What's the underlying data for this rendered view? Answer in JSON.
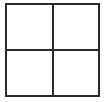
{
  "figure": {
    "kind": "quadrant-grid",
    "background_color": "#ffffff",
    "line_color": "#2a2a2a",
    "outer_line_width_px": 2,
    "inner_line_width_px": 2,
    "rows": 2,
    "columns": 2,
    "caption": "",
    "title": ""
  },
  "chart_data": {
    "type": "table",
    "title": "",
    "xlabel": "",
    "ylabel": "",
    "rows": 2,
    "columns": 2,
    "grid": true,
    "legend": "none",
    "cells": [
      {
        "row": 0,
        "col": 0,
        "name": "top-left",
        "text": "",
        "fill": "#ffffff"
      },
      {
        "row": 0,
        "col": 1,
        "name": "top-right",
        "text": "",
        "fill": "#ffffff"
      },
      {
        "row": 1,
        "col": 0,
        "name": "bottom-left",
        "text": "",
        "fill": "#ffffff"
      },
      {
        "row": 1,
        "col": 1,
        "name": "bottom-right",
        "text": "",
        "fill": "#ffffff"
      }
    ]
  }
}
